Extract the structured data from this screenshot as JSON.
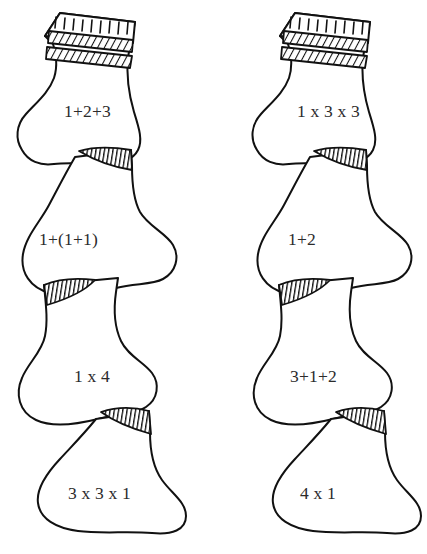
{
  "figure": {
    "kind": "line-drawing",
    "background_color": "#ffffff",
    "ink_color": "#111111",
    "text_color": "#2b2b2b",
    "columns": 2,
    "socks_per_column": 4
  },
  "columns": [
    {
      "name": "left-column",
      "socks": [
        {
          "position": 1,
          "label": "1+2+3",
          "orientation": "toe-left",
          "has_cuff": true,
          "has_overlap_hatch": false,
          "label_x": 64,
          "label_y": 103
        },
        {
          "position": 2,
          "label": "1+(1+1)",
          "orientation": "toe-right",
          "has_cuff": false,
          "has_overlap_hatch": true,
          "label_x": 39,
          "label_y": 231
        },
        {
          "position": 3,
          "label": "1 x 4",
          "orientation": "toe-left",
          "has_cuff": false,
          "has_overlap_hatch": true,
          "label_x": 74,
          "label_y": 368
        },
        {
          "position": 4,
          "label": "3 x 3 x 1",
          "orientation": "toe-right",
          "has_cuff": false,
          "has_overlap_hatch": true,
          "label_x": 68,
          "label_y": 485
        }
      ]
    },
    {
      "name": "right-column",
      "socks": [
        {
          "position": 1,
          "label": "1 x 3 x 3",
          "orientation": "toe-left",
          "has_cuff": true,
          "has_overlap_hatch": false,
          "label_x": 297,
          "label_y": 103
        },
        {
          "position": 2,
          "label": "1+2",
          "orientation": "toe-right",
          "has_cuff": false,
          "has_overlap_hatch": true,
          "label_x": 288,
          "label_y": 231
        },
        {
          "position": 3,
          "label": "3+1+2",
          "orientation": "toe-left",
          "has_cuff": false,
          "has_overlap_hatch": true,
          "label_x": 290,
          "label_y": 368
        },
        {
          "position": 4,
          "label": "4 x 1",
          "orientation": "toe-right",
          "has_cuff": false,
          "has_overlap_hatch": true,
          "label_x": 300,
          "label_y": 485
        }
      ]
    }
  ]
}
